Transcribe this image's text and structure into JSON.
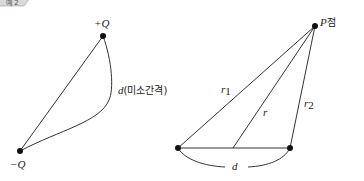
{
  "corner_tag": {
    "text": "예 2"
  },
  "left_diagram": {
    "title": "dipole",
    "positive_charge_label": "+Q",
    "negative_charge_label": "−Q",
    "distance_label_var": "d",
    "distance_label_text": "(미소간격)",
    "points": {
      "positive": [
        103,
        36
      ],
      "negative": [
        20,
        151
      ]
    }
  },
  "right_diagram": {
    "point_label_var": "P",
    "point_label_text": "점",
    "r1_label": "r",
    "r1_sub": "1",
    "r_label": "r",
    "r2_label": "r",
    "r2_sub": "2",
    "d_label": "d",
    "points": {
      "P": [
        315,
        26
      ],
      "left": [
        178,
        148
      ],
      "mid": [
        233,
        148
      ],
      "right": [
        290,
        148
      ]
    }
  }
}
